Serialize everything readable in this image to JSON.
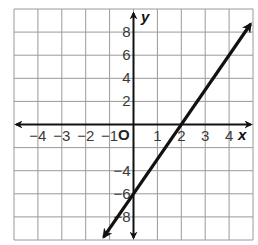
{
  "chart_data": {
    "type": "line",
    "title": "",
    "xlabel": "x",
    "ylabel": "y",
    "origin_label": "O",
    "xlim": [
      -5,
      5
    ],
    "ylim": [
      -10,
      10
    ],
    "grid": true,
    "x_grid_step": 1,
    "y_grid_step": 2,
    "x_ticks": [
      -4,
      -3,
      -2,
      -1,
      1,
      2,
      3,
      4
    ],
    "x_tick_labels": [
      "−4",
      "−3",
      "−2",
      "−1",
      "1",
      "2",
      "3",
      "4"
    ],
    "y_ticks": [
      8,
      6,
      4,
      2,
      -4,
      -6,
      -8
    ],
    "y_tick_labels": [
      "8",
      "6",
      "4",
      "2",
      "−4",
      "−6",
      "−8"
    ],
    "series": [
      {
        "name": "y = 3x - 6",
        "slope": 3,
        "intercept": -6,
        "x": [
          -1.25,
          4.9
        ],
        "y": [
          -9.75,
          8.7
        ],
        "arrows": "both",
        "color": "#111111"
      }
    ],
    "key_points": [
      {
        "x": 0,
        "y": -6
      },
      {
        "x": 2,
        "y": 0
      }
    ],
    "legend": null
  },
  "colors": {
    "grid": "#9a9a9a",
    "axis": "#111111",
    "line": "#111111",
    "background": "#ffffff"
  }
}
